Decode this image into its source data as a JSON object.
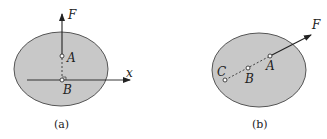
{
  "colors": {
    "body_fill": "#c8c8c8",
    "body_stroke": "#555555",
    "line": "#222222",
    "background": "#ffffff"
  },
  "figures": [
    {
      "caption": "(a)",
      "force_label": "F",
      "points": [
        "A",
        "B"
      ],
      "axis_label": "x",
      "notes": "Force F acts vertically at point A; perpendicular dashed line from A to B on the x axis (right-angle marker at B)."
    },
    {
      "caption": "(b)",
      "force_label": "F",
      "points": [
        "A",
        "B",
        "C"
      ],
      "notes": "Force F acts at A along the line of action passing through B and C (dashed)."
    }
  ]
}
